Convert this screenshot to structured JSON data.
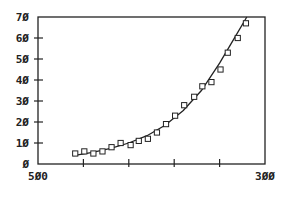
{
  "chart_data": {
    "type": "scatter",
    "title": "",
    "xlabel": "",
    "ylabel": "",
    "xlim": [
      50,
      300
    ],
    "ylim": [
      0,
      70
    ],
    "grid": false,
    "legend": null,
    "x_tick_labels": [
      "50",
      "300"
    ],
    "x_ticks": [
      50,
      100,
      150,
      200,
      250,
      300
    ],
    "y_tick_labels": [
      "0",
      "10",
      "20",
      "30",
      "40",
      "50",
      "60",
      "70"
    ],
    "y_ticks": [
      0,
      10,
      20,
      30,
      40,
      50,
      60,
      70
    ],
    "series": [
      {
        "name": "observed",
        "style": "open-square-markers",
        "x": [
          91,
          101,
          111,
          121,
          131,
          141,
          152,
          161,
          171,
          181,
          191,
          201,
          211,
          222,
          231,
          241,
          251,
          259,
          270,
          279
        ],
        "y": [
          5,
          6,
          5,
          6,
          8,
          10,
          9,
          11,
          12,
          15,
          19,
          23,
          28,
          32,
          37,
          39,
          45,
          53,
          60,
          67
        ]
      },
      {
        "name": "fitted-curve",
        "style": "solid-line",
        "x": [
          89,
          110,
          130,
          150,
          170,
          190,
          210,
          230,
          250,
          265,
          280
        ],
        "y": [
          4,
          5.5,
          7.5,
          10,
          13.5,
          18.5,
          25.5,
          35,
          48,
          59,
          70
        ]
      }
    ]
  },
  "axes": {
    "x_labels": [
      {
        "value": 50,
        "text": "5Ø0"
      },
      {
        "value": 300,
        "text": "3ØØ"
      }
    ],
    "y_labels": [
      {
        "value": 0,
        "text": "Ø"
      },
      {
        "value": 10,
        "text": "1Ø"
      },
      {
        "value": 20,
        "text": "2Ø"
      },
      {
        "value": 30,
        "text": "3Ø"
      },
      {
        "value": 40,
        "text": "4Ø"
      },
      {
        "value": 50,
        "text": "5Ø"
      },
      {
        "value": 60,
        "text": "6Ø"
      },
      {
        "value": 70,
        "text": "7Ø"
      }
    ]
  },
  "colors": {
    "axis": "#222222",
    "marker": "#222222",
    "curve": "#222222",
    "background": "#ffffff"
  }
}
